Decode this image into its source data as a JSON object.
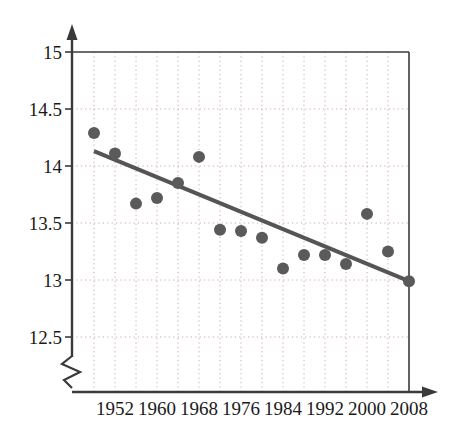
{
  "chart_data": {
    "type": "scatter",
    "title": "",
    "xlabel": "",
    "ylabel": "",
    "x": [
      1948,
      1952,
      1956,
      1960,
      1964,
      1968,
      1972,
      1976,
      1980,
      1984,
      1988,
      1992,
      1996,
      2000,
      2004,
      2008
    ],
    "values": [
      14.29,
      14.11,
      13.67,
      13.72,
      13.85,
      14.08,
      13.44,
      13.43,
      13.37,
      13.1,
      13.22,
      13.22,
      13.14,
      13.58,
      13.25,
      12.99
    ],
    "series": [
      {
        "name": "data-points",
        "values": [
          14.29,
          14.11,
          13.67,
          13.72,
          13.85,
          14.08,
          13.44,
          13.43,
          13.37,
          13.1,
          13.22,
          13.22,
          13.14,
          13.58,
          13.25,
          12.99
        ]
      },
      {
        "name": "trend-line",
        "type": "line",
        "x": [
          1948,
          2008
        ],
        "values": [
          14.13,
          12.99
        ]
      }
    ],
    "xlim": [
      1946,
      2010
    ],
    "ylim": [
      12.4,
      15.0
    ],
    "y_ticks": [
      "12.5",
      "13",
      "13.5",
      "14",
      "14.5",
      "15"
    ],
    "y_tick_values": [
      12.5,
      13,
      13.5,
      14,
      14.5,
      15
    ],
    "x_ticks": [
      "1952",
      "1960",
      "1968",
      "1976",
      "1984",
      "1992",
      "2000",
      "2008"
    ],
    "x_tick_values": [
      1952,
      1960,
      1968,
      1976,
      1984,
      1992,
      2000,
      2008
    ],
    "grid": true,
    "grid_style": "dotted",
    "axis_break": true,
    "axis_break_label": "y-axis-break",
    "legend": "none",
    "colors": {
      "point": "#5a5a5a",
      "trend_line": "#555555",
      "grid": "#c9a8a8",
      "axis": "#3a3a3a",
      "text": "#1a1a1a",
      "background": "#ffffff"
    },
    "point_radius": 6,
    "trend_line_width": 4
  }
}
